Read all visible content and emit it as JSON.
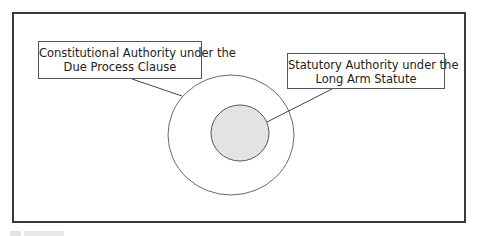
{
  "diagram": {
    "type": "nested-circles",
    "outer_circle": {
      "label_line1": "Constitutional Authority under the",
      "label_line2": "Due Process Clause",
      "fill": "#ffffff",
      "stroke": "#6b6b6b"
    },
    "inner_circle": {
      "label_line1": "Statutory Authority under the",
      "label_line2": "Long Arm Statute",
      "fill": "#e3e3e3",
      "stroke": "#555555"
    },
    "frame_color": "#3a3a3a"
  }
}
